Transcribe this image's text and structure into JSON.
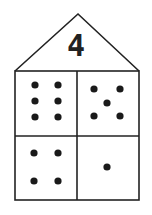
{
  "house": {
    "number": "4",
    "cells": [
      {
        "position": "top-left",
        "dots": 6
      },
      {
        "position": "top-right",
        "dots": 5
      },
      {
        "position": "bottom-left",
        "dots": 4
      },
      {
        "position": "bottom-right",
        "dots": 1
      }
    ],
    "colors": {
      "line": "#222222",
      "dot": "#1a1a1a",
      "background": "#ffffff"
    }
  }
}
